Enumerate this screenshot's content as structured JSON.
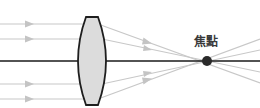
{
  "diagram": {
    "focal_label": "焦點",
    "lens_type": "biconvex",
    "incoming_rays": 4,
    "colors": {
      "ray": "#c8c8c8",
      "axis": "#1a1a1a",
      "lens_fill": "#dcdcdc",
      "lens_stroke": "#1e1e1e",
      "focal_point": "#2a2a2a",
      "label": "#3a3a3a"
    },
    "icons": [
      "arrowhead-icon",
      "focal-point-icon"
    ]
  }
}
